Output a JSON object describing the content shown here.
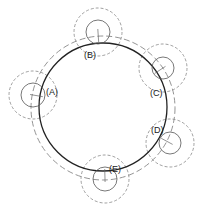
{
  "diagram": {
    "main_circle": {
      "cx": 103,
      "cy": 107,
      "r": 64,
      "color": "#222222"
    },
    "outer_dashed_circle": {
      "cx": 103,
      "cy": 108,
      "r": 72,
      "color": "#888888"
    },
    "nodes": [
      {
        "label": "(A)",
        "cx": 33,
        "cy": 95,
        "r_inner": 12,
        "r_outer": 24,
        "lx": 46,
        "ly": 92
      },
      {
        "label": "(B)",
        "cx": 98,
        "cy": 32,
        "r_inner": 12,
        "r_outer": 24,
        "lx": 84,
        "ly": 55
      },
      {
        "label": "(C)",
        "cx": 163,
        "cy": 68,
        "r_inner": 11,
        "r_outer": 24,
        "lx": 150,
        "ly": 93
      },
      {
        "label": "(D)",
        "cx": 170,
        "cy": 143,
        "r_inner": 11,
        "r_outer": 24,
        "lx": 151,
        "ly": 130
      },
      {
        "label": "(E)",
        "cx": 105,
        "cy": 179,
        "r_inner": 12,
        "r_outer": 24,
        "lx": 109,
        "ly": 169
      }
    ]
  }
}
